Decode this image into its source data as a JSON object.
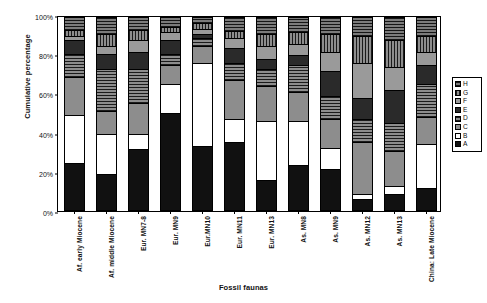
{
  "chart_data": {
    "type": "bar",
    "subtype": "stacked-100-percent",
    "title": "",
    "xlabel": "Fossil faunas",
    "ylabel": "Cumulative percentage",
    "ylim": [
      0,
      100
    ],
    "ytick_labels": [
      "0%",
      "20%",
      "40%",
      "60%",
      "80%",
      "100%"
    ],
    "ytick_values": [
      0,
      20,
      40,
      60,
      80,
      100
    ],
    "grid": false,
    "legend_position": "right",
    "legend_order_top_to_bottom": [
      "H",
      "G",
      "F",
      "E",
      "D",
      "C",
      "B",
      "A"
    ],
    "categories": [
      "Af. early Miocene",
      "Af. middle Miocene",
      "Eur. MN7-8",
      "Eur. MN9",
      "Eur.MN10",
      "Eur. MN11",
      "Eur. MN13",
      "As. MN8",
      "As. MN9",
      "As. MN12",
      "As. MN13",
      "China: Late Miocene"
    ],
    "series": [
      {
        "name": "A",
        "fill": "solid-black",
        "values": [
          24,
          18,
          31,
          50,
          33,
          35,
          15,
          23,
          21,
          5,
          8,
          11
        ]
      },
      {
        "name": "B",
        "fill": "solid-white",
        "values": [
          25,
          21,
          8,
          15,
          43,
          12,
          31,
          23,
          11,
          3,
          4,
          23
        ]
      },
      {
        "name": "C",
        "fill": "solid-grey",
        "values": [
          20,
          12,
          16,
          10,
          9,
          20,
          18,
          15,
          15,
          27,
          18,
          14
        ]
      },
      {
        "name": "D",
        "fill": "grey-horizontal-lines",
        "values": [
          12,
          22,
          18,
          6,
          4,
          9,
          9,
          14,
          12,
          12,
          15,
          17
        ]
      },
      {
        "name": "E",
        "fill": "solid-dark",
        "values": [
          7,
          8,
          9,
          7,
          2,
          8,
          5,
          5,
          13,
          11,
          17,
          10
        ]
      },
      {
        "name": "F",
        "fill": "solid-light-grey",
        "values": [
          2,
          4,
          6,
          4,
          3,
          5,
          7,
          6,
          10,
          18,
          12,
          7
        ]
      },
      {
        "name": "G",
        "fill": "grey-vertical-lines",
        "values": [
          3,
          6,
          5,
          3,
          3,
          4,
          6,
          6,
          9,
          14,
          14,
          8
        ]
      },
      {
        "name": "H",
        "fill": "dark-grey-horizontal-lines",
        "values": [
          7,
          9,
          7,
          5,
          3,
          7,
          9,
          8,
          9,
          10,
          12,
          10
        ]
      }
    ]
  }
}
